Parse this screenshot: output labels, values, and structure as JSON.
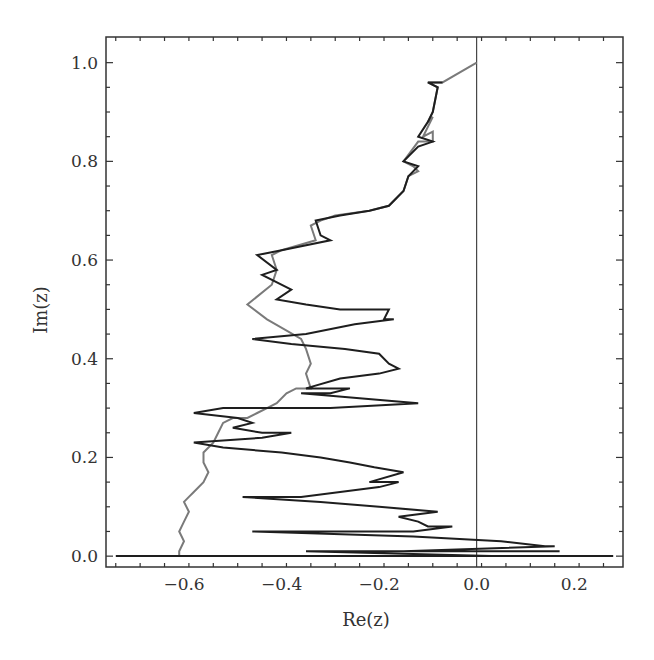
{
  "chart_data": {
    "type": "line",
    "title": "",
    "xlabel": "Re(z)",
    "ylabel": "Im(z)",
    "xlim": [
      -0.76,
      0.3
    ],
    "ylim": [
      -0.022,
      1.052
    ],
    "x_ticks": [
      -0.6,
      -0.4,
      -0.2,
      0.0,
      0.2
    ],
    "x_tick_labels": [
      "−0.6",
      "−0.4",
      "−0.2",
      "0.0",
      "0.2"
    ],
    "y_ticks": [
      0.0,
      0.2,
      0.4,
      0.6,
      0.8,
      1.0
    ],
    "y_tick_labels": [
      "0.0",
      "0.2",
      "0.4",
      "0.6",
      "0.8",
      "1.0"
    ],
    "grid": false,
    "legend": null,
    "reference_lines": [
      {
        "orientation": "vertical",
        "x": 0.0
      }
    ],
    "series": [
      {
        "name": "trajectory-gray",
        "color": "#7a7a7a",
        "points": [
          [
            0.0,
            1.0
          ],
          [
            -0.07,
            0.96
          ],
          [
            -0.1,
            0.96
          ],
          [
            -0.08,
            0.95
          ],
          [
            -0.09,
            0.9
          ],
          [
            -0.1,
            0.88
          ],
          [
            -0.09,
            0.89
          ],
          [
            -0.11,
            0.85
          ],
          [
            -0.09,
            0.86
          ],
          [
            -0.09,
            0.84
          ],
          [
            -0.12,
            0.84
          ],
          [
            -0.15,
            0.8
          ],
          [
            -0.13,
            0.79
          ],
          [
            -0.12,
            0.78
          ],
          [
            -0.14,
            0.77
          ],
          [
            -0.15,
            0.74
          ],
          [
            -0.18,
            0.71
          ],
          [
            -0.22,
            0.7
          ],
          [
            -0.29,
            0.69
          ],
          [
            -0.32,
            0.68
          ],
          [
            -0.34,
            0.67
          ],
          [
            -0.33,
            0.64
          ],
          [
            -0.4,
            0.62
          ],
          [
            -0.42,
            0.61
          ],
          [
            -0.41,
            0.58
          ],
          [
            -0.42,
            0.55
          ],
          [
            -0.47,
            0.51
          ],
          [
            -0.43,
            0.48
          ],
          [
            -0.36,
            0.44
          ],
          [
            -0.35,
            0.42
          ],
          [
            -0.34,
            0.39
          ],
          [
            -0.35,
            0.37
          ],
          [
            -0.34,
            0.34
          ],
          [
            -0.37,
            0.34
          ],
          [
            -0.39,
            0.33
          ],
          [
            -0.41,
            0.31
          ],
          [
            -0.43,
            0.3
          ],
          [
            -0.45,
            0.29
          ],
          [
            -0.47,
            0.28
          ],
          [
            -0.5,
            0.28
          ],
          [
            -0.52,
            0.27
          ],
          [
            -0.53,
            0.25
          ],
          [
            -0.54,
            0.23
          ],
          [
            -0.56,
            0.21
          ],
          [
            -0.56,
            0.19
          ],
          [
            -0.55,
            0.17
          ],
          [
            -0.56,
            0.15
          ],
          [
            -0.58,
            0.13
          ],
          [
            -0.59,
            0.12
          ],
          [
            -0.6,
            0.11
          ],
          [
            -0.59,
            0.09
          ],
          [
            -0.6,
            0.07
          ],
          [
            -0.61,
            0.05
          ],
          [
            -0.6,
            0.03
          ],
          [
            -0.61,
            0.01
          ],
          [
            -0.61,
            0.0
          ]
        ]
      },
      {
        "name": "trajectory-black",
        "color": "#1e1e1e",
        "points": [
          [
            -0.07,
            0.96
          ],
          [
            -0.1,
            0.96
          ],
          [
            -0.08,
            0.95
          ],
          [
            -0.09,
            0.9
          ],
          [
            -0.1,
            0.88
          ],
          [
            -0.12,
            0.85
          ],
          [
            -0.09,
            0.84
          ],
          [
            -0.12,
            0.83
          ],
          [
            -0.15,
            0.8
          ],
          [
            -0.12,
            0.79
          ],
          [
            -0.14,
            0.77
          ],
          [
            -0.15,
            0.74
          ],
          [
            -0.18,
            0.71
          ],
          [
            -0.22,
            0.7
          ],
          [
            -0.28,
            0.69
          ],
          [
            -0.33,
            0.68
          ],
          [
            -0.32,
            0.65
          ],
          [
            -0.3,
            0.64
          ],
          [
            -0.4,
            0.62
          ],
          [
            -0.45,
            0.61
          ],
          [
            -0.41,
            0.58
          ],
          [
            -0.44,
            0.57
          ],
          [
            -0.38,
            0.54
          ],
          [
            -0.41,
            0.52
          ],
          [
            -0.35,
            0.51
          ],
          [
            -0.28,
            0.5
          ],
          [
            -0.18,
            0.5
          ],
          [
            -0.19,
            0.48
          ],
          [
            -0.17,
            0.48
          ],
          [
            -0.25,
            0.47
          ],
          [
            -0.35,
            0.45
          ],
          [
            -0.46,
            0.44
          ],
          [
            -0.38,
            0.43
          ],
          [
            -0.27,
            0.42
          ],
          [
            -0.2,
            0.41
          ],
          [
            -0.18,
            0.39
          ],
          [
            -0.16,
            0.38
          ],
          [
            -0.2,
            0.37
          ],
          [
            -0.28,
            0.36
          ],
          [
            -0.35,
            0.34
          ],
          [
            -0.26,
            0.34
          ],
          [
            -0.3,
            0.33
          ],
          [
            -0.36,
            0.33
          ],
          [
            -0.24,
            0.32
          ],
          [
            -0.12,
            0.31
          ],
          [
            -0.3,
            0.3
          ],
          [
            -0.52,
            0.3
          ],
          [
            -0.58,
            0.29
          ],
          [
            -0.49,
            0.28
          ],
          [
            -0.46,
            0.27
          ],
          [
            -0.5,
            0.26
          ],
          [
            -0.44,
            0.25
          ],
          [
            -0.38,
            0.25
          ],
          [
            -0.44,
            0.24
          ],
          [
            -0.58,
            0.23
          ],
          [
            -0.52,
            0.22
          ],
          [
            -0.4,
            0.21
          ],
          [
            -0.32,
            0.2
          ],
          [
            -0.26,
            0.19
          ],
          [
            -0.21,
            0.18
          ],
          [
            -0.15,
            0.17
          ],
          [
            -0.22,
            0.15
          ],
          [
            -0.16,
            0.15
          ],
          [
            -0.2,
            0.14
          ],
          [
            -0.28,
            0.13
          ],
          [
            -0.36,
            0.12
          ],
          [
            -0.48,
            0.12
          ],
          [
            -0.32,
            0.11
          ],
          [
            -0.2,
            0.1
          ],
          [
            -0.08,
            0.09
          ],
          [
            -0.16,
            0.08
          ],
          [
            -0.12,
            0.07
          ],
          [
            -0.1,
            0.06
          ],
          [
            -0.05,
            0.06
          ],
          [
            -0.13,
            0.05
          ],
          [
            -0.46,
            0.05
          ],
          [
            -0.13,
            0.04
          ],
          [
            0.05,
            0.03
          ],
          [
            0.14,
            0.02
          ],
          [
            0.16,
            0.02
          ],
          [
            -0.15,
            0.01
          ],
          [
            0.17,
            0.01
          ],
          [
            -0.35,
            0.01
          ],
          [
            0.03,
            0.0
          ],
          [
            -0.74,
            0.0
          ],
          [
            0.28,
            0.0
          ]
        ]
      }
    ]
  }
}
